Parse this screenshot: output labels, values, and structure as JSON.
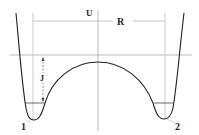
{
  "diagram": {
    "type": "double-well-potential",
    "labels": {
      "potential": "U",
      "distance": "R",
      "barrier": "J",
      "well_left": "1",
      "well_right": "2"
    },
    "colors": {
      "curve": "#222222",
      "guide": "#b0b0b0",
      "axis": "#a8a8a8",
      "text": "#222222"
    }
  }
}
